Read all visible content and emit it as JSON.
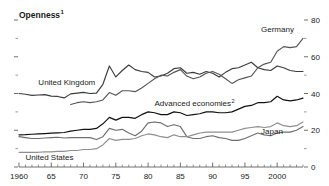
{
  "chart_data": {
    "type": "line",
    "title": "Openness",
    "title_footnote": "1",
    "xlabel": "",
    "ylabel": "",
    "xlim": [
      1960,
      2004
    ],
    "ylim": [
      0,
      80
    ],
    "y_axis_position": "right",
    "yticks": [
      0,
      20,
      40,
      60,
      80
    ],
    "ytick_labels": [
      "0",
      "20",
      "40",
      "60",
      "80"
    ],
    "y_minor_ticks": [
      10,
      30,
      50,
      70
    ],
    "xticks": [
      1960,
      1965,
      1970,
      1975,
      1980,
      1985,
      1990,
      1995,
      2000
    ],
    "xtick_labels": [
      "1960",
      "65",
      "70",
      "75",
      "80",
      "85",
      "90",
      "95",
      "2000"
    ],
    "x_minor_tick_step": 1,
    "grid": false,
    "legend_position": "inline-annotations",
    "series": [
      {
        "name": "United Kingdom",
        "color": "#3c3c3c",
        "label_x": 1963.0,
        "label_y": 44.5,
        "label_anchor": "start",
        "x": [
          1960,
          1961,
          1962,
          1963,
          1964,
          1965,
          1966,
          1967,
          1968,
          1969,
          1970,
          1971,
          1972,
          1973,
          1974,
          1975,
          1976,
          1977,
          1978,
          1979,
          1980,
          1981,
          1982,
          1983,
          1984,
          1985,
          1986,
          1987,
          1988,
          1989,
          1990,
          1991,
          1992,
          1993,
          1994,
          1995,
          1996,
          1997,
          1998,
          1999,
          2000,
          2001,
          2002,
          2003,
          2004
        ],
        "values": [
          40.0,
          39.6,
          39.0,
          39.2,
          39.4,
          38.6,
          38.4,
          37.6,
          39.8,
          40.2,
          40.6,
          40.0,
          40.2,
          45.0,
          55.0,
          49.0,
          52.5,
          55.5,
          53.0,
          52.0,
          51.5,
          49.0,
          49.5,
          51.0,
          53.5,
          54.0,
          51.0,
          51.5,
          50.5,
          52.0,
          51.0,
          49.0,
          51.5,
          53.5,
          54.0,
          55.5,
          57.0,
          54.0,
          53.0,
          52.5,
          55.0,
          54.0,
          52.5,
          52.0,
          52.0
        ]
      },
      {
        "name": "Germany",
        "color": "#555555",
        "label_x": 1997.5,
        "label_y": 73.5,
        "label_anchor": "start",
        "x": [
          1968,
          1969,
          1970,
          1971,
          1972,
          1973,
          1974,
          1975,
          1976,
          1977,
          1978,
          1979,
          1980,
          1981,
          1982,
          1983,
          1984,
          1985,
          1986,
          1987,
          1988,
          1989,
          1990,
          1991,
          1992,
          1993,
          1994,
          1995,
          1996,
          1997,
          1998,
          1999,
          2000,
          2001,
          2002,
          2003,
          2004
        ],
        "values": [
          34.0,
          35.0,
          35.5,
          35.0,
          35.5,
          36.5,
          40.5,
          39.0,
          41.5,
          41.5,
          41.0,
          43.0,
          45.5,
          48.0,
          50.0,
          49.5,
          51.5,
          53.0,
          49.5,
          48.0,
          49.0,
          51.0,
          52.0,
          50.5,
          48.0,
          45.5,
          47.5,
          48.5,
          49.5,
          54.0,
          56.0,
          57.0,
          63.0,
          65.5,
          65.0,
          65.5,
          70.0
        ]
      },
      {
        "name": "Advanced economies",
        "footnote": "2",
        "color": "#111111",
        "label_x": 1981.0,
        "label_y": 33.0,
        "label_anchor": "start",
        "x": [
          1960,
          1961,
          1962,
          1963,
          1964,
          1965,
          1966,
          1967,
          1968,
          1969,
          1970,
          1971,
          1972,
          1973,
          1974,
          1975,
          1976,
          1977,
          1978,
          1979,
          1980,
          1981,
          1982,
          1983,
          1984,
          1985,
          1986,
          1987,
          1988,
          1989,
          1990,
          1991,
          1992,
          1993,
          1994,
          1995,
          1996,
          1997,
          1998,
          1999,
          2000,
          2001,
          2002,
          2003,
          2004
        ],
        "values": [
          17.5,
          17.6,
          17.8,
          18.0,
          18.2,
          18.4,
          18.6,
          18.8,
          19.5,
          20.0,
          20.5,
          20.5,
          21.0,
          23.5,
          27.0,
          25.5,
          27.0,
          27.0,
          26.5,
          28.5,
          30.0,
          29.5,
          28.5,
          28.5,
          30.0,
          29.5,
          28.0,
          28.5,
          29.0,
          30.0,
          30.0,
          29.5,
          29.5,
          30.0,
          31.5,
          33.0,
          33.5,
          35.0,
          35.0,
          35.5,
          38.5,
          36.5,
          36.0,
          36.5,
          37.5
        ]
      },
      {
        "name": "Japan",
        "color": "#6e6e6e",
        "label_x": 1997.5,
        "label_y": 18.0,
        "label_anchor": "start",
        "x": [
          1960,
          1961,
          1962,
          1963,
          1964,
          1965,
          1966,
          1967,
          1968,
          1969,
          1970,
          1971,
          1972,
          1973,
          1974,
          1975,
          1976,
          1977,
          1978,
          1979,
          1980,
          1981,
          1982,
          1983,
          1984,
          1985,
          1986,
          1987,
          1988,
          1989,
          1990,
          1991,
          1992,
          1993,
          1994,
          1995,
          1996,
          1997,
          1998,
          1999,
          2000,
          2001,
          2002,
          2003,
          2004
        ],
        "values": [
          16.5,
          16.0,
          15.5,
          15.5,
          15.8,
          16.0,
          16.2,
          15.8,
          16.0,
          16.0,
          16.0,
          16.0,
          15.0,
          16.5,
          21.0,
          20.0,
          20.5,
          18.5,
          17.0,
          19.5,
          24.0,
          24.5,
          24.0,
          22.0,
          23.0,
          22.0,
          16.5,
          15.5,
          15.5,
          16.5,
          17.0,
          16.0,
          15.5,
          14.5,
          14.5,
          15.5,
          17.0,
          18.5,
          17.5,
          17.0,
          18.5,
          19.0,
          19.0,
          20.0,
          22.0
        ]
      },
      {
        "name": "United States",
        "color": "#8f8f8f",
        "label_x": 1961.0,
        "label_y": 4.0,
        "label_anchor": "start",
        "x": [
          1960,
          1961,
          1962,
          1963,
          1964,
          1965,
          1966,
          1967,
          1968,
          1969,
          1970,
          1971,
          1972,
          1973,
          1974,
          1975,
          1976,
          1977,
          1978,
          1979,
          1980,
          1981,
          1982,
          1983,
          1984,
          1985,
          1986,
          1987,
          1988,
          1989,
          1990,
          1991,
          1992,
          1993,
          1994,
          1995,
          1996,
          1997,
          1998,
          1999,
          2000,
          2001,
          2002,
          2003,
          2004
        ],
        "values": [
          8.0,
          8.0,
          8.0,
          8.0,
          8.2,
          8.2,
          8.5,
          8.5,
          9.0,
          9.0,
          9.5,
          9.5,
          10.0,
          12.0,
          15.5,
          14.5,
          15.0,
          15.0,
          15.5,
          17.0,
          18.0,
          17.5,
          16.5,
          16.0,
          17.5,
          16.5,
          16.5,
          17.5,
          18.5,
          19.0,
          19.0,
          19.0,
          19.0,
          19.0,
          20.0,
          21.0,
          21.5,
          22.0,
          21.5,
          22.0,
          24.0,
          22.5,
          22.0,
          22.5,
          24.5
        ]
      }
    ]
  }
}
